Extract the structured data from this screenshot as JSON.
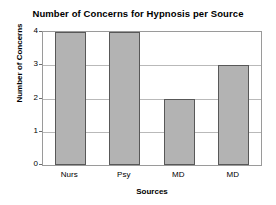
{
  "chart_data": {
    "type": "bar",
    "title": "Number of Concerns for Hypnosis per Source",
    "xlabel": "Sources",
    "ylabel": "Number of Concerns",
    "categories": [
      "Nurs",
      "Psy",
      "MD",
      "MD"
    ],
    "values": [
      4,
      4,
      2,
      3
    ],
    "ylim": [
      0,
      4
    ],
    "yticks": [
      "0",
      "1",
      "2",
      "3",
      "4"
    ],
    "ytick_values": [
      0,
      1,
      2,
      3,
      4
    ],
    "grid": true,
    "legend": false,
    "bar_fill_color": "#b3b3b3",
    "bar_edge_color": "#585858",
    "gridline_color": "#b9b9b9",
    "axis_color": "#9a9a9a",
    "background_color": "#ffffff"
  }
}
